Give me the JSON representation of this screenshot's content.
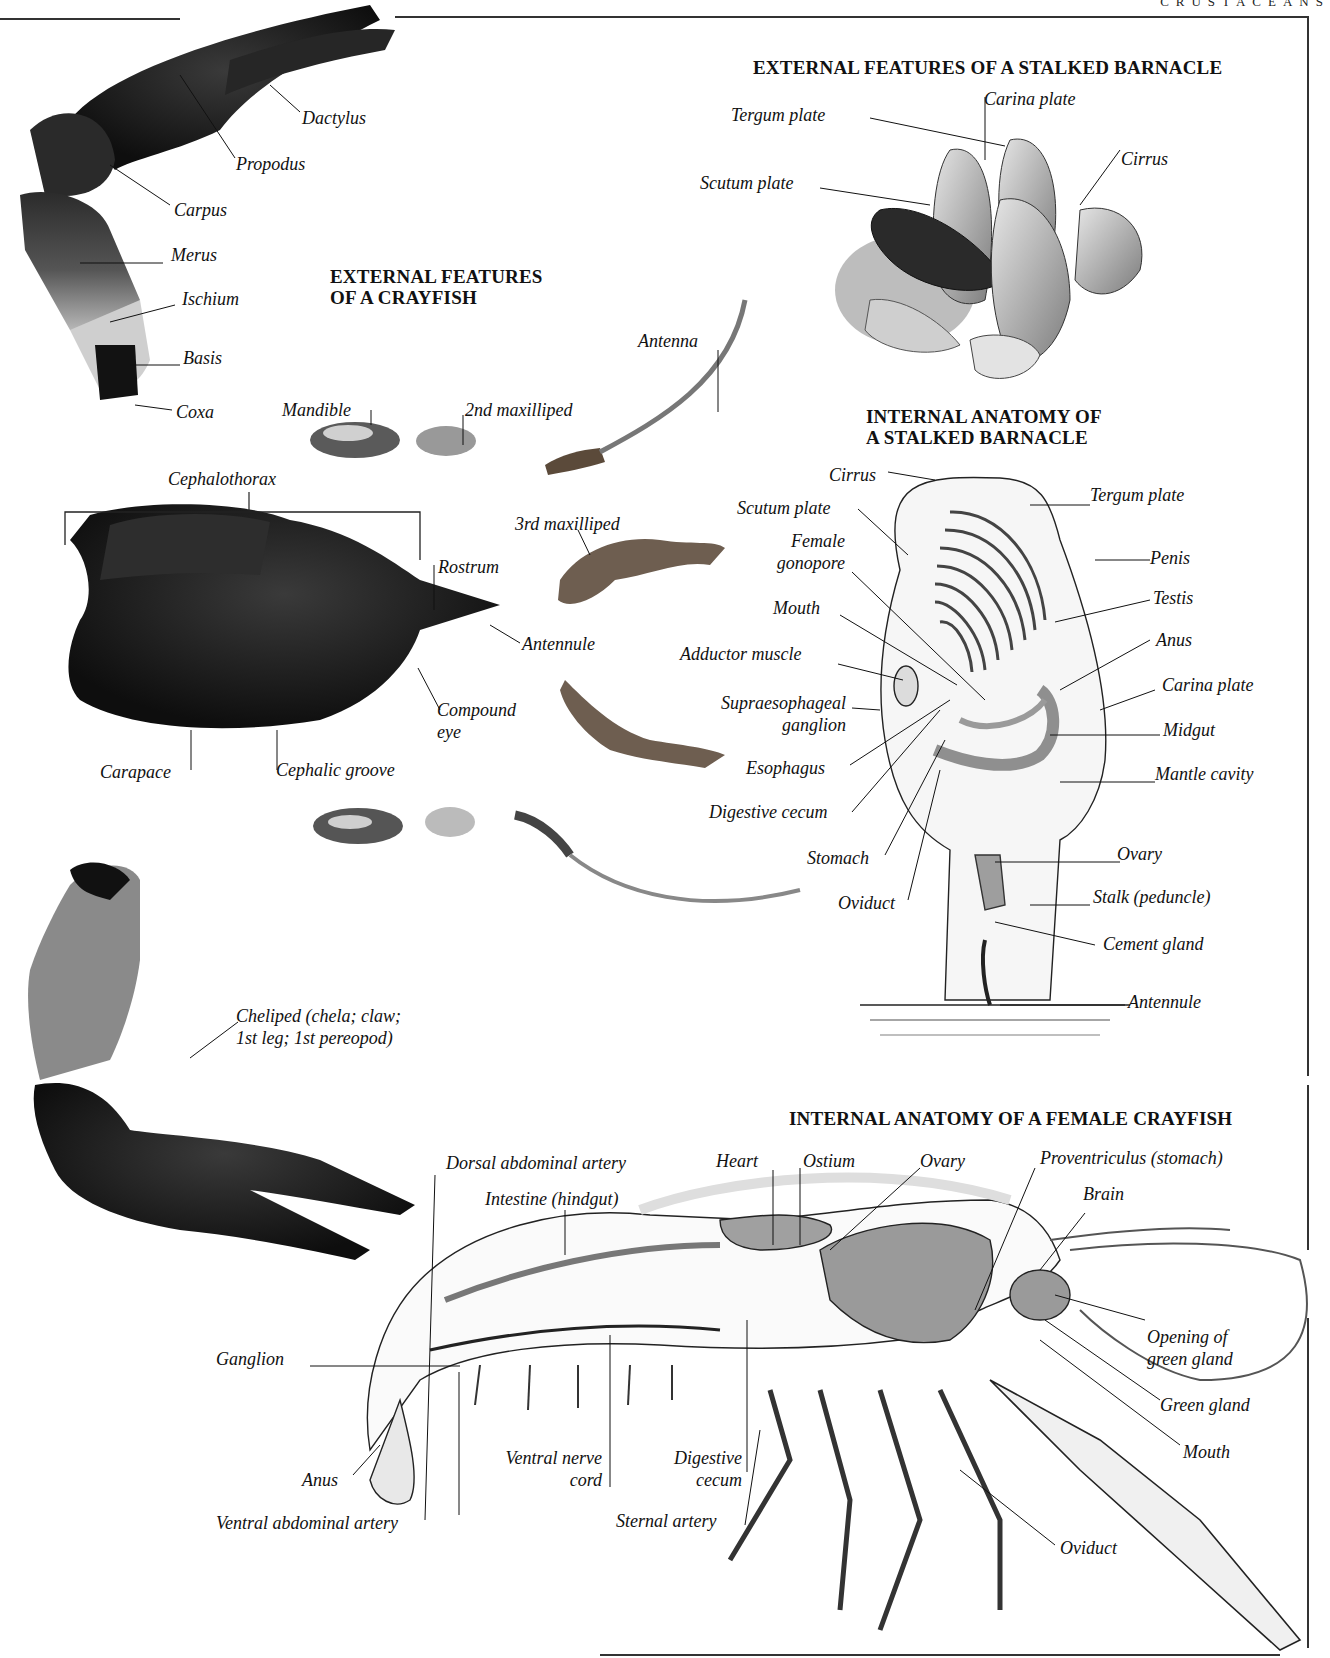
{
  "page": {
    "running_head": "CRUSTACEANS"
  },
  "crayfish_external": {
    "title_line1": "EXTERNAL FEATURES",
    "title_line2": "OF A CRAYFISH",
    "walking_leg_labels": {
      "dactylus": "Dactylus",
      "propodus": "Propodus",
      "carpus": "Carpus",
      "merus": "Merus",
      "ischium": "Ischium",
      "basis": "Basis",
      "coxa": "Coxa"
    },
    "appendage_labels": {
      "mandible": "Mandible",
      "second_maxilliped": "2nd maxilliped",
      "antenna": "Antenna",
      "third_maxilliped": "3rd maxilliped"
    },
    "cephalothorax_labels": {
      "cephalothorax": "Cephalothorax",
      "rostrum": "Rostrum",
      "antennule": "Antennule",
      "compound_eye_line1": "Compound",
      "compound_eye_line2": "eye",
      "carapace": "Carapace",
      "cephalic_groove": "Cephalic groove"
    },
    "cheliped_label_line1": "Cheliped (chela; claw;",
    "cheliped_label_line2": "1st leg; 1st pereopod)"
  },
  "barnacle_external": {
    "title": "EXTERNAL FEATURES OF A STALKED BARNACLE",
    "labels": {
      "tergum_plate": "Tergum plate",
      "carina_plate": "Carina plate",
      "cirrus": "Cirrus",
      "scutum_plate": "Scutum plate"
    }
  },
  "barnacle_internal": {
    "title_line1": "INTERNAL ANATOMY OF",
    "title_line2": "A STALKED BARNACLE",
    "labels_left": {
      "cirrus": "Cirrus",
      "scutum_plate": "Scutum plate",
      "female_gonopore_line1": "Female",
      "female_gonopore_line2": "gonopore",
      "mouth": "Mouth",
      "adductor_muscle": "Adductor muscle",
      "supraesophageal_line1": "Supraesophageal",
      "supraesophageal_line2": "ganglion",
      "esophagus": "Esophagus",
      "digestive_cecum": "Digestive cecum",
      "stomach": "Stomach",
      "oviduct": "Oviduct"
    },
    "labels_right": {
      "tergum_plate": "Tergum plate",
      "penis": "Penis",
      "testis": "Testis",
      "anus": "Anus",
      "carina_plate": "Carina plate",
      "midgut": "Midgut",
      "mantle_cavity": "Mantle cavity",
      "ovary": "Ovary",
      "stalk": "Stalk (peduncle)",
      "cement_gland": "Cement gland",
      "antennule": "Antennule"
    }
  },
  "crayfish_internal": {
    "title": "INTERNAL ANATOMY OF A FEMALE CRAYFISH",
    "labels_top": {
      "dorsal_abdominal_artery": "Dorsal abdominal artery",
      "intestine": "Intestine (hindgut)",
      "heart": "Heart",
      "ostium": "Ostium",
      "ovary": "Ovary",
      "proventriculus": "Proventriculus (stomach)",
      "brain": "Brain"
    },
    "labels_right": {
      "opening_green_gland_line1": "Opening of",
      "opening_green_gland_line2": "green gland",
      "green_gland": "Green gland",
      "mouth": "Mouth",
      "oviduct": "Oviduct"
    },
    "labels_bottom": {
      "ganglion": "Ganglion",
      "anus": "Anus",
      "ventral_nerve_cord_line1": "Ventral nerve",
      "ventral_nerve_cord_line2": "cord",
      "digestive_cecum_line1": "Digestive",
      "digestive_cecum_line2": "cecum",
      "ventral_abdominal_artery": "Ventral abdominal artery",
      "sternal_artery": "Sternal artery"
    }
  },
  "colors": {
    "ink": "#111111",
    "photo_dark": "#1a1a1a",
    "photo_mid": "#6b6b6b",
    "photo_light": "#c8c8c8",
    "drawing_fill": "#9a9a9a",
    "paper": "#ffffff"
  }
}
